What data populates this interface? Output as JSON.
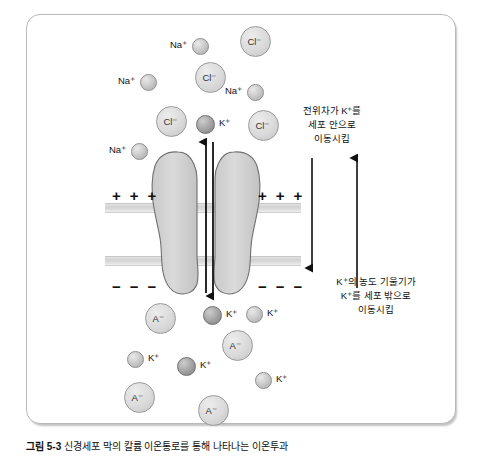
{
  "figure": {
    "caption_number": "그림 5-3",
    "caption_text": "신경세포 막의 칼륨 이온통로를 통해 나타나는 이온투과",
    "alt_title": "세포막 칼륨 이온통로 확산 모식도"
  },
  "annotations": {
    "electrical_gradient": {
      "id": "electrical-gradient-note",
      "lines": [
        "전위차가 K⁺를",
        "세포 안으로",
        "이동시킴"
      ],
      "text": "전위차가 K⁺를\n세포 안으로\n이동시킴"
    },
    "concentration_gradient": {
      "id": "concentration-gradient-note",
      "lines": [
        "K⁺의 농도 기울기가",
        "K⁺를 세포 밖으로",
        "이동시킴"
      ],
      "text": "K⁺의 농도 기울기가\nK⁺를 세포 밖으로\n이동시킴"
    }
  },
  "membrane": {
    "charges_outer": [
      "+",
      "+",
      "+"
    ],
    "charges_inner": [
      "−",
      "−",
      "−"
    ],
    "outer_charge_sign": "+",
    "inner_charge_sign": "−",
    "band_color": "#d6d6d6",
    "protein_color": "#d2d2d2"
  },
  "arrows": {
    "channel_up": {
      "name": "channel-up-arrow",
      "direction": "up",
      "meaning": "K⁺ inward"
    },
    "channel_down": {
      "name": "channel-down-arrow",
      "direction": "down",
      "meaning": "K⁺ outward"
    },
    "side_down": {
      "name": "electrical-gradient-arrow",
      "direction": "down"
    },
    "side_up": {
      "name": "concentration-gradient-arrow",
      "direction": "up"
    }
  },
  "ions": {
    "extracellular": [
      {
        "species": "Na",
        "charge": "+",
        "label": "Na⁺",
        "style": "small",
        "label_pos": "left",
        "x": 192,
        "y": 38
      },
      {
        "species": "Cl",
        "charge": "−",
        "label": "Cl⁻",
        "style": "big",
        "label_pos": "in",
        "x": 240,
        "y": 26
      },
      {
        "species": "Na",
        "charge": "+",
        "label": "Na⁺",
        "style": "small",
        "label_pos": "left",
        "x": 140,
        "y": 74
      },
      {
        "species": "Cl",
        "charge": "−",
        "label": "Cl⁻",
        "style": "big",
        "label_pos": "in",
        "x": 195,
        "y": 62
      },
      {
        "species": "Na",
        "charge": "+",
        "label": "Na⁺",
        "style": "small",
        "label_pos": "left",
        "x": 247,
        "y": 84
      },
      {
        "species": "Cl",
        "charge": "−",
        "label": "Cl⁻",
        "style": "big",
        "label_pos": "in",
        "x": 156,
        "y": 106
      },
      {
        "species": "K",
        "charge": "+",
        "label": "K⁺",
        "style": "dark",
        "label_pos": "right",
        "x": 196,
        "y": 115
      },
      {
        "species": "Cl",
        "charge": "−",
        "label": "Cl⁻",
        "style": "big",
        "label_pos": "in",
        "x": 248,
        "y": 110
      },
      {
        "species": "Na",
        "charge": "+",
        "label": "Na⁺",
        "style": "small",
        "label_pos": "left",
        "x": 131,
        "y": 143
      }
    ],
    "intracellular": [
      {
        "species": "A",
        "charge": "−",
        "label": "A⁻",
        "style": "big",
        "label_pos": "in",
        "x": 145,
        "y": 303
      },
      {
        "species": "K",
        "charge": "+",
        "label": "K⁺",
        "style": "dark",
        "label_pos": "right",
        "x": 203,
        "y": 306
      },
      {
        "species": "K",
        "charge": "+",
        "label": "K⁺",
        "style": "small",
        "label_pos": "right",
        "x": 246,
        "y": 306
      },
      {
        "species": "A",
        "charge": "−",
        "label": "A⁻",
        "style": "big",
        "label_pos": "in",
        "x": 222,
        "y": 330
      },
      {
        "species": "K",
        "charge": "+",
        "label": "K⁺",
        "style": "small",
        "label_pos": "right",
        "x": 127,
        "y": 351
      },
      {
        "species": "K",
        "charge": "+",
        "label": "K⁺",
        "style": "dark",
        "label_pos": "right",
        "x": 177,
        "y": 357
      },
      {
        "species": "A",
        "charge": "−",
        "label": "A⁻",
        "style": "big",
        "label_pos": "in",
        "x": 124,
        "y": 382
      },
      {
        "species": "K",
        "charge": "+",
        "label": "K⁺",
        "style": "small",
        "label_pos": "right",
        "x": 255,
        "y": 372
      },
      {
        "species": "A",
        "charge": "−",
        "label": "A⁻",
        "style": "big",
        "label_pos": "in",
        "x": 198,
        "y": 395
      }
    ]
  }
}
